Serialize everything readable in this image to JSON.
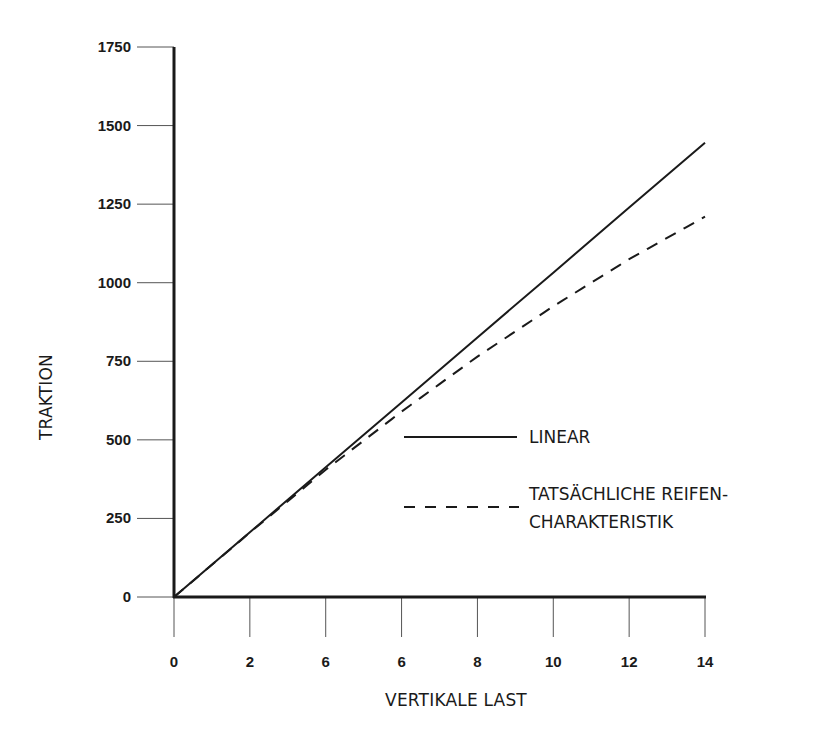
{
  "chart_data": {
    "type": "line",
    "title": "",
    "xlabel": "VERTIKALE LAST",
    "ylabel": "TRAKTION",
    "x_tick_labels": [
      "0",
      "2",
      "6",
      "6",
      "8",
      "10",
      "12",
      "14"
    ],
    "x": [
      0,
      2,
      4,
      6,
      8,
      10,
      12,
      14
    ],
    "y_tick_labels": [
      "0",
      "250",
      "500",
      "750",
      "1000",
      "1250",
      "1500",
      "1750"
    ],
    "xlim": [
      0,
      14
    ],
    "ylim": [
      0,
      1750
    ],
    "grid": false,
    "legend_position": "inside right",
    "series": [
      {
        "name": "LINEAR",
        "style": "solid",
        "values": [
          0,
          206,
          413,
          619,
          826,
          1032,
          1239,
          1445
        ]
      },
      {
        "name": "TATSÄCHLICHE REIFEN-CHARAKTERISTIK",
        "style": "dashed",
        "values": [
          0,
          205,
          405,
          590,
          765,
          925,
          1075,
          1210
        ]
      }
    ]
  },
  "axes": {
    "x_title": "VERTIKALE LAST",
    "y_title": "TRAKTION"
  },
  "legend": {
    "linear": "LINEAR",
    "actual_line1": "TATSÄCHLICHE REIFEN-",
    "actual_line2": "CHARAKTERISTIK"
  },
  "colors": {
    "line": "#1a1a1a",
    "tick": "#555555",
    "background": "#ffffff"
  }
}
